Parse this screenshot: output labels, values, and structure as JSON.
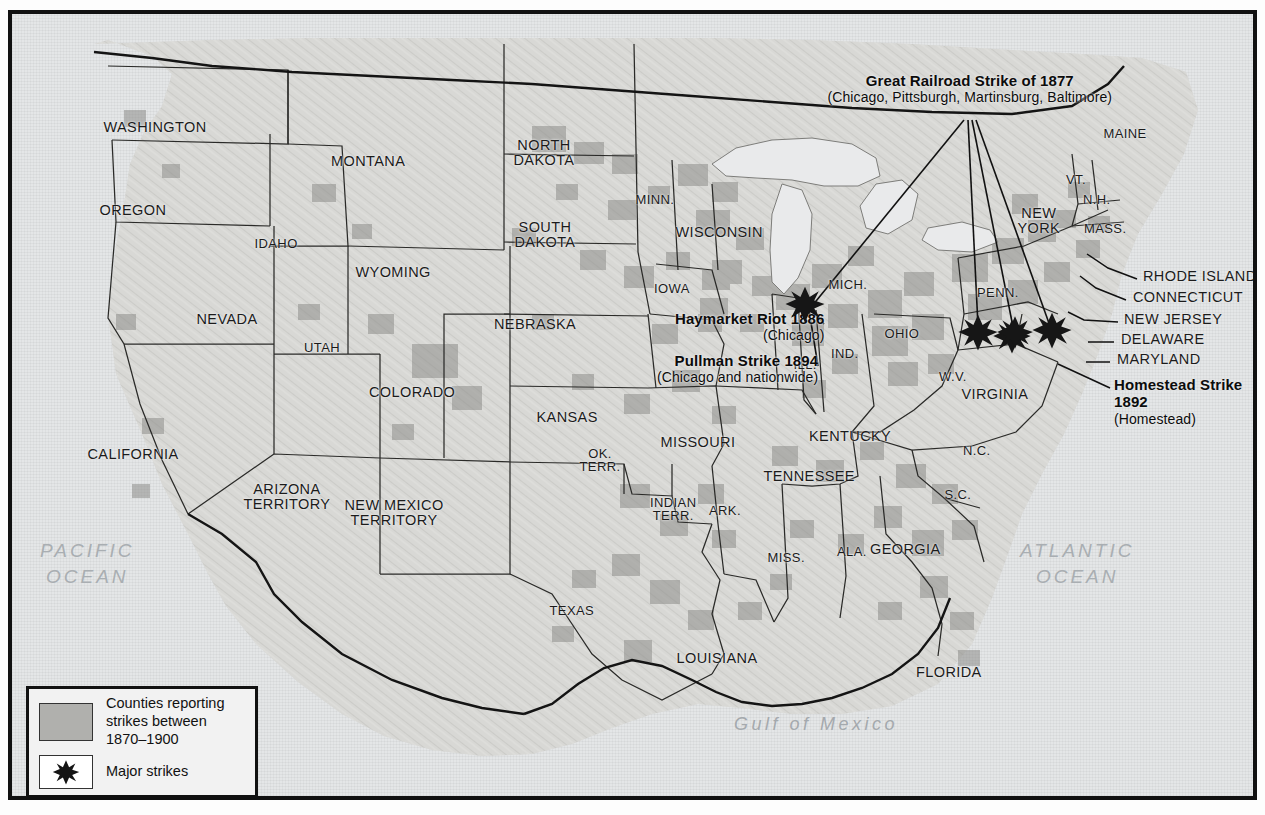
{
  "map": {
    "title_region": "United States labor strikes 1870-1900",
    "oceans": [
      {
        "name": "pacific",
        "label": "PACIFIC\nOCEAN"
      },
      {
        "name": "atlantic",
        "label": "ATLANTIC\nOCEAN"
      }
    ],
    "gulf": {
      "label": "Gulf of Mexico"
    },
    "states": [
      {
        "id": "washington",
        "label": "WASHINGTON",
        "x": 143,
        "y": 113
      },
      {
        "id": "oregon",
        "label": "OREGON",
        "x": 121,
        "y": 196
      },
      {
        "id": "idaho",
        "label": "IDAHO",
        "x": 264,
        "y": 230
      },
      {
        "id": "montana",
        "label": "MONTANA",
        "x": 356,
        "y": 147
      },
      {
        "id": "wyoming",
        "label": "WYOMING",
        "x": 381,
        "y": 258
      },
      {
        "id": "nevada",
        "label": "NEVADA",
        "x": 215,
        "y": 305
      },
      {
        "id": "utah",
        "label": "UTAH",
        "x": 310,
        "y": 334
      },
      {
        "id": "colorado",
        "label": "COLORADO",
        "x": 400,
        "y": 378
      },
      {
        "id": "california",
        "label": "CALIFORNIA",
        "x": 121,
        "y": 440
      },
      {
        "id": "arizona-territory",
        "label": "ARIZONA\nTERRITORY",
        "x": 275,
        "y": 483
      },
      {
        "id": "new-mexico-territory",
        "label": "NEW MEXICO\nTERRITORY",
        "x": 382,
        "y": 499
      },
      {
        "id": "north-dakota",
        "label": "NORTH\nDAKOTA",
        "x": 532,
        "y": 139
      },
      {
        "id": "south-dakota",
        "label": "SOUTH\nDAKOTA",
        "x": 533,
        "y": 221
      },
      {
        "id": "nebraska",
        "label": "NEBRASKA",
        "x": 523,
        "y": 310
      },
      {
        "id": "kansas",
        "label": "KANSAS",
        "x": 555,
        "y": 403
      },
      {
        "id": "minnesota",
        "label": "MINN.",
        "x": 643,
        "y": 186
      },
      {
        "id": "iowa",
        "label": "IOWA",
        "x": 660,
        "y": 275
      },
      {
        "id": "missouri",
        "label": "MISSOURI",
        "x": 686,
        "y": 428
      },
      {
        "id": "oklahoma-territory",
        "label": "OK.\nTERR.",
        "x": 588,
        "y": 446
      },
      {
        "id": "indian-territory",
        "label": "INDIAN\nTERR.",
        "x": 661,
        "y": 495
      },
      {
        "id": "arkansas",
        "label": "ARK.",
        "x": 713,
        "y": 497
      },
      {
        "id": "texas",
        "label": "TEXAS",
        "x": 560,
        "y": 597
      },
      {
        "id": "louisiana",
        "label": "LOUISIANA",
        "x": 705,
        "y": 644
      },
      {
        "id": "wisconsin",
        "label": "WISCONSIN",
        "x": 707,
        "y": 218
      },
      {
        "id": "illinois",
        "label": "ILL.",
        "x": 793,
        "y": 351
      },
      {
        "id": "indiana",
        "label": "IND.",
        "x": 833,
        "y": 340
      },
      {
        "id": "michigan",
        "label": "MICH.",
        "x": 836,
        "y": 271
      },
      {
        "id": "ohio",
        "label": "OHIO",
        "x": 890,
        "y": 320
      },
      {
        "id": "kentucky",
        "label": "KENTUCKY",
        "x": 838,
        "y": 422
      },
      {
        "id": "tennessee",
        "label": "TENNESSEE",
        "x": 797,
        "y": 462
      },
      {
        "id": "mississippi",
        "label": "MISS.",
        "x": 774,
        "y": 544
      },
      {
        "id": "alabama",
        "label": "ALA.",
        "x": 840,
        "y": 538
      },
      {
        "id": "georgia",
        "label": "GEORGIA",
        "x": 893,
        "y": 535
      },
      {
        "id": "florida",
        "label": "FLORIDA",
        "x": 937,
        "y": 658
      },
      {
        "id": "south-carolina",
        "label": "S.C.",
        "x": 946,
        "y": 481
      },
      {
        "id": "north-carolina",
        "label": "N.C.",
        "x": 965,
        "y": 437
      },
      {
        "id": "west-virginia",
        "label": "W.V.",
        "x": 941,
        "y": 363
      },
      {
        "id": "virginia",
        "label": "VIRGINIA",
        "x": 983,
        "y": 380
      },
      {
        "id": "pennsylvania",
        "label": "PENN.",
        "x": 986,
        "y": 279
      },
      {
        "id": "new-york",
        "label": "NEW\nYORK",
        "x": 1027,
        "y": 207
      },
      {
        "id": "maine",
        "label": "MAINE",
        "x": 1113,
        "y": 120
      },
      {
        "id": "vermont",
        "label": "VT.",
        "x": 1064,
        "y": 166
      },
      {
        "id": "new-hampshire",
        "label": "N.H.",
        "x": 1085,
        "y": 186
      },
      {
        "id": "massachusetts",
        "label": "MASS.",
        "x": 1093,
        "y": 215
      }
    ],
    "leader_states": [
      {
        "id": "rhode-island",
        "label": "RHODE ISLAND",
        "x": 1131,
        "y": 262
      },
      {
        "id": "connecticut",
        "label": "CONNECTICUT",
        "x": 1121,
        "y": 283
      },
      {
        "id": "new-jersey",
        "label": "NEW JERSEY",
        "x": 1112,
        "y": 305
      },
      {
        "id": "delaware",
        "label": "DELAWARE",
        "x": 1109,
        "y": 325
      },
      {
        "id": "maryland",
        "label": "MARYLAND",
        "x": 1105,
        "y": 345
      }
    ],
    "annotations": [
      {
        "id": "great-railroad-strike",
        "title": "Great Railroad Strike of 1877",
        "subtitle": "(Chicago, Pittsburgh, Martinsburg, Baltimore)"
      },
      {
        "id": "haymarket-riot",
        "title": "Haymarket Riot 1886",
        "subtitle": "(Chicago)"
      },
      {
        "id": "pullman-strike",
        "title": "Pullman Strike 1894",
        "subtitle": "(Chicago and nationwide)"
      },
      {
        "id": "homestead-strike",
        "title": "Homestead Strike\n1892",
        "subtitle": "(Homestead)"
      }
    ],
    "legend": {
      "counties_label": "Counties reporting\nstrikes between\n1870–1900",
      "major_strikes_label": "Major strikes"
    },
    "colors": {
      "frame": "#111111",
      "land": "#d6d6d4",
      "water": "#e4e6e7",
      "county_shade": "#adadaa",
      "label_text": "#1b1b1b",
      "ocean_text": "#a9aeb2"
    }
  }
}
